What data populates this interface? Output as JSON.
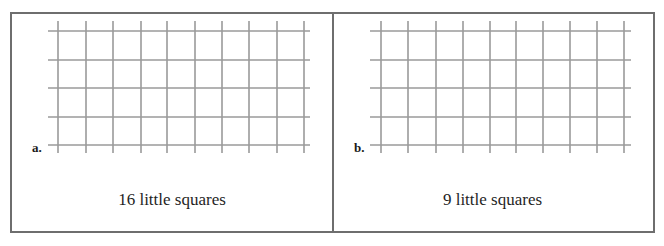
{
  "panels": [
    {
      "id": "a",
      "label": "a.",
      "caption": "16 little squares",
      "grid": {
        "rows": 5,
        "columns": 10,
        "line_color": "#9a9a9a"
      }
    },
    {
      "id": "b",
      "label": "b.",
      "caption": "9 little squares",
      "grid": {
        "rows": 5,
        "columns": 10,
        "line_color": "#9a9a9a"
      }
    }
  ],
  "colors": {
    "border": "#6e6e6e",
    "text": "#1a1a1a",
    "background": "#ffffff"
  }
}
